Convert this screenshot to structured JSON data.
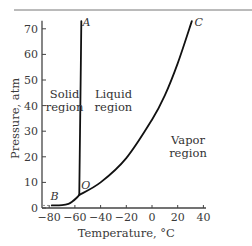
{
  "chart_data": {
    "type": "line",
    "title": "",
    "xlabel": "Temperature, °C",
    "ylabel": "Pressure, atm",
    "xlim": [
      -85,
      45
    ],
    "ylim": [
      0,
      72
    ],
    "xticks": [
      -80,
      -60,
      -40,
      -20,
      0,
      20,
      40
    ],
    "xtick_labels": [
      "−80",
      "−60",
      "−40",
      "−20",
      "0",
      "20",
      "40"
    ],
    "yticks": [
      0,
      10,
      20,
      30,
      40,
      50,
      60,
      70
    ],
    "ytick_labels": [
      "0",
      "10",
      "20",
      "30",
      "40",
      "50",
      "60",
      "70"
    ],
    "grid": false,
    "series": [
      {
        "name": "OA (solid–liquid)",
        "points": [
          [
            -56.6,
            5.1
          ],
          [
            -56.0,
            30
          ],
          [
            -55.4,
            55
          ],
          [
            -55.0,
            73
          ]
        ]
      },
      {
        "name": "OB (solid–vapor)",
        "points": [
          [
            -78,
            1
          ],
          [
            -70,
            1.1
          ],
          [
            -65,
            1.6
          ],
          [
            -62,
            2.5
          ],
          [
            -59,
            3.8
          ],
          [
            -56.6,
            5.1
          ]
        ]
      },
      {
        "name": "OC (liquid–vapor)",
        "points": [
          [
            -56.6,
            5.1
          ],
          [
            -40,
            10
          ],
          [
            -20,
            19.5
          ],
          [
            0,
            34.5
          ],
          [
            10,
            44
          ],
          [
            20,
            56.5
          ],
          [
            31,
            73
          ]
        ]
      }
    ],
    "annotations": [
      {
        "text": "A",
        "x": -54,
        "y": 71,
        "style": "italic"
      },
      {
        "text": "C",
        "x": 33,
        "y": 71,
        "style": "italic"
      },
      {
        "text": "B",
        "x": -79,
        "y": 3,
        "style": "italic"
      },
      {
        "text": "O",
        "x": -55,
        "y": 7.5,
        "style": "normal"
      }
    ],
    "regions": [
      {
        "lines": [
          "Solid",
          "region"
        ],
        "x": -68,
        "y": 43
      },
      {
        "lines": [
          "Liquid",
          "region"
        ],
        "x": -30,
        "y": 43
      },
      {
        "lines": [
          "Vapor",
          "region"
        ],
        "x": 28,
        "y": 25
      }
    ],
    "dashed_reference": {
      "y": 1,
      "x_from": -85,
      "x_to": -78
    }
  }
}
